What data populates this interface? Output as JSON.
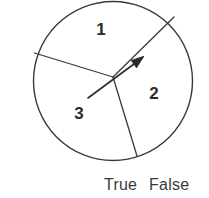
{
  "figure": {
    "type": "spinner-diagram",
    "stroke_color": "#3a3a3a",
    "fill_color": "#ffffff",
    "circle": {
      "cx": 113,
      "cy": 81,
      "r": 80
    },
    "center_point": {
      "x": 113,
      "y": 77
    },
    "sectors": [
      {
        "label": "1",
        "label_x": 101,
        "label_y": 31,
        "boundary_x": 174,
        "boundary_y": 17
      },
      {
        "label": "2",
        "label_x": 154,
        "label_y": 95,
        "boundary_x": 137,
        "boundary_y": 156
      },
      {
        "label": "3",
        "label_x": 79,
        "label_y": 115,
        "boundary_x": 35,
        "boundary_y": 53
      }
    ],
    "pointer": {
      "tail_x": 88,
      "tail_y": 98,
      "tip_x": 143,
      "tip_y": 57,
      "color": "#2b2b2b"
    }
  },
  "answers": {
    "options": [
      {
        "label": "True"
      },
      {
        "label": "False"
      }
    ]
  }
}
